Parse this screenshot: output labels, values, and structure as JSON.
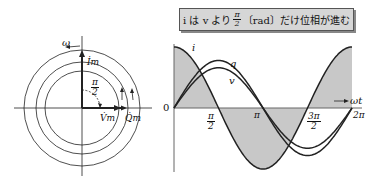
{
  "phasor": {
    "omega_label": "ω",
    "current_label": "İm",
    "voltage_label": "V̇m",
    "charge_label": "Q̇m",
    "angle_num": "π",
    "angle_den": "2"
  },
  "banner": {
    "pre": "i は v より",
    "frac_num": "π",
    "frac_den": "2",
    "post": "〔rad〕だけ位相が進む"
  },
  "chart_data": {
    "type": "line",
    "xlabel": "ωt",
    "ylabel": "",
    "x_ticks": [
      "0",
      "π/2",
      "π",
      "3π/2",
      "2π"
    ],
    "series": [
      {
        "name": "i",
        "function": "cos(ωt)",
        "amplitude": 1.0,
        "shaded": true
      },
      {
        "name": "q",
        "function": "sin(ωt)",
        "amplitude": 0.78
      },
      {
        "name": "v",
        "function": "sin(ωt)",
        "amplitude": 0.66
      }
    ],
    "grid": false
  },
  "ticks": {
    "zero": "0",
    "pi_half_num": "π",
    "pi_half_den": "2",
    "pi": "π",
    "three_pi_half_num": "3π",
    "three_pi_half_den": "2",
    "two_pi": "2π",
    "axis": "→ ωt"
  },
  "curve_labels": {
    "i": "i",
    "q": "q",
    "v": "v"
  }
}
